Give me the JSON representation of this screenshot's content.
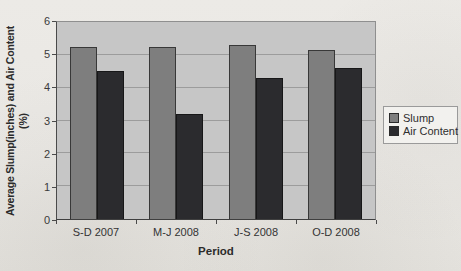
{
  "chart_data": {
    "type": "bar",
    "title": "",
    "xlabel": "Period",
    "ylabel": "Average Slump(inches) and Air Content (%)",
    "ylabel_lines": [
      "Average Slump(inches) and Air Content",
      "(%)"
    ],
    "categories": [
      "S-D 2007",
      "M-J 2008",
      "J-S 2008",
      "O-D 2008"
    ],
    "series": [
      {
        "name": "Slump",
        "color": "#7e7e7e",
        "values": [
          5.25,
          5.25,
          5.3,
          5.15
        ]
      },
      {
        "name": "Air Content",
        "color": "#2b2b2e",
        "values": [
          4.5,
          3.2,
          4.3,
          4.6
        ]
      }
    ],
    "ylim": [
      0,
      6
    ],
    "ytick_step": 1,
    "grid": true,
    "legend_position": "right",
    "colors": {
      "plot_background": "#c6c6c6",
      "gridline": "#9c9c9c",
      "legend_background": "#f2f1ee",
      "legend_border": "#9a9a9a"
    }
  }
}
